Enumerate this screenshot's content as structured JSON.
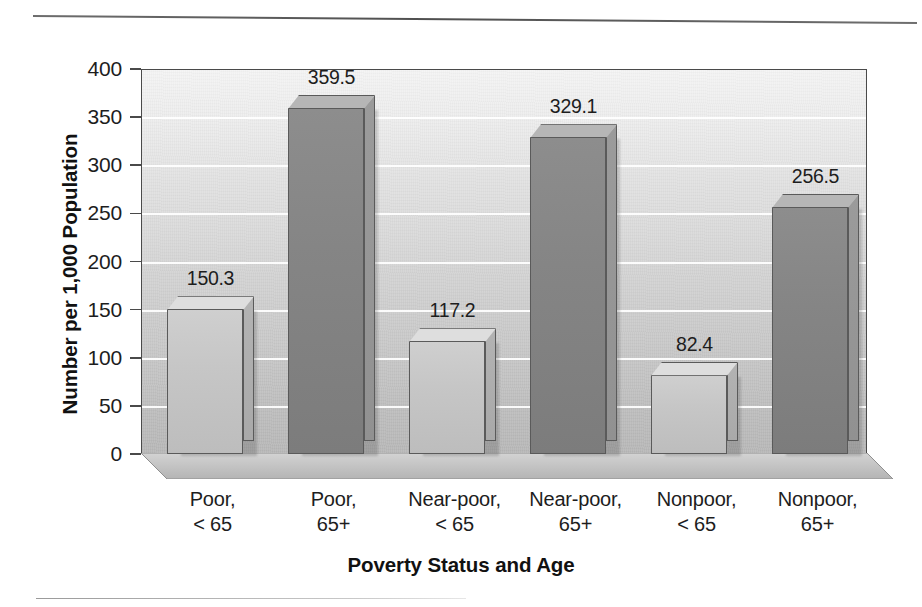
{
  "chart_data": {
    "type": "bar",
    "title": "",
    "xlabel": "Poverty Status and Age",
    "ylabel": "Number per 1,000 Population",
    "categories": [
      "Poor, < 65",
      "Poor, 65+",
      "Near-poor, < 65",
      "Near-poor, 65+",
      "Nonpoor, < 65",
      "Nonpoor, 65+"
    ],
    "category_lines": [
      [
        "Poor,",
        "< 65"
      ],
      [
        "Poor,",
        "65+"
      ],
      [
        "Near-poor,",
        "< 65"
      ],
      [
        "Near-poor,",
        "65+"
      ],
      [
        "Nonpoor,",
        "< 65"
      ],
      [
        "Nonpoor,",
        "65+"
      ]
    ],
    "values": [
      150.3,
      359.5,
      117.2,
      329.1,
      82.4,
      256.5
    ],
    "value_labels": [
      "150.3",
      "359.5",
      "117.2",
      "329.1",
      "82.4",
      "256.5"
    ],
    "bar_styles": [
      "light",
      "dark",
      "light",
      "dark",
      "light",
      "dark"
    ],
    "ylim": [
      0,
      400
    ],
    "yticks": [
      0,
      50,
      100,
      150,
      200,
      250,
      300,
      350,
      400
    ],
    "ytick_labels": [
      "0",
      "50",
      "100",
      "150",
      "200",
      "250",
      "300",
      "350",
      "400"
    ],
    "grid": true,
    "grid_color": "#ffffff",
    "legend": "none",
    "style": "3d-columns",
    "colors": {
      "light_bar": "#c6c6c6",
      "dark_bar": "#858585",
      "bar_outline": "#5a5a5a",
      "plot_background_top": "#f4f4f4",
      "plot_background_bottom": "#b8b8b8",
      "axis": "#4a4a4a",
      "text": "#1d1d1d"
    }
  }
}
